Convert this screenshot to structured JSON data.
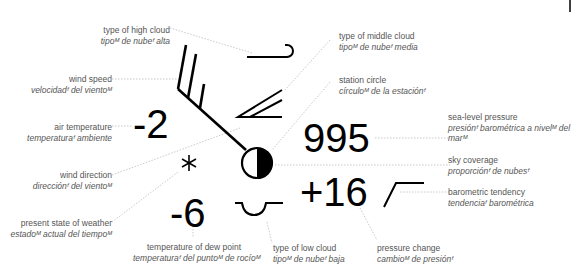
{
  "station_model": {
    "values": {
      "air_temperature": "-2",
      "dew_point": "-6",
      "sea_level_pressure": "995",
      "pressure_change": "+16"
    },
    "labels": {
      "high_cloud": {
        "en": "type of high cloud",
        "es": "tipoᴹ de nubeᶠ alta"
      },
      "wind_speed": {
        "en": "wind speed",
        "es": "velocidadᶠ del vientoᴹ"
      },
      "air_temperature": {
        "en": "air temperature",
        "es": "temperaturaᶠ ambiente"
      },
      "wind_direction": {
        "en": "wind direction",
        "es": "direcciónᶠ del vientoᴹ"
      },
      "present_weather": {
        "en": "present state of weather",
        "es": "estadoᴹ actual del tiempoᴹ"
      },
      "dew_point": {
        "en": "temperature of dew point",
        "es": "temperaturaᶠ del puntoᴹ de rocíoᴹ"
      },
      "low_cloud": {
        "en": "type of low cloud",
        "es": "tipoᴹ de nubeᶠ baja"
      },
      "pressure_change": {
        "en": "pressure change",
        "es": "cambioᴹ de presiónᶠ"
      },
      "middle_cloud": {
        "en": "type of middle cloud",
        "es": "tipoᴹ de nubeᶠ media"
      },
      "station_circle": {
        "en": "station circle",
        "es": "círculoᴹ de la estaciónᶠ"
      },
      "sea_level_pressure": {
        "en": "sea-level pressure",
        "es": "presiónᶠ barométrica a nivelᴹ del",
        "es2": "marᴹ"
      },
      "sky_coverage": {
        "en": "sky coverage",
        "es": "proporciónᶠ de nubesᶠ"
      },
      "barometric_tendency": {
        "en": "barometric tendency",
        "es": "tendenciaᶠ barométrica"
      }
    },
    "symbols": {
      "present_weather": "snow-asterisk",
      "sky_coverage": "half-filled-circle",
      "high_cloud": "cirrus-hook",
      "middle_cloud": "altostratus-wedge",
      "low_cloud": "stratocumulus-cup",
      "barometric_tendency": "rising-then-steady",
      "wind": "wind-barb-2-full-1-half"
    }
  }
}
